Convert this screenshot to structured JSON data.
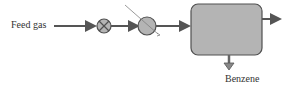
{
  "diagram": {
    "type": "process-flow",
    "inlet_label": "Feed gas",
    "outlet_bottom_label": "Benzene",
    "nodes": [
      {
        "id": "valve",
        "shape": "circle-x"
      },
      {
        "id": "heat-exchanger",
        "shape": "circle-diagonal"
      },
      {
        "id": "vessel",
        "shape": "rounded-rect"
      }
    ],
    "colors": {
      "fill": "#b4b4b4",
      "stroke": "#505050",
      "line": "#555555"
    }
  }
}
